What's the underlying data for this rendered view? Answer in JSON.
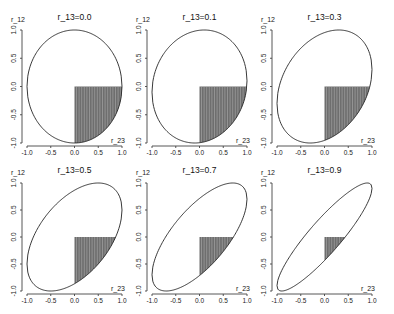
{
  "chart_data": {
    "type": "line",
    "layout": "2x3 small multiples",
    "xlabel": "r_23",
    "ylabel": "r_12",
    "xlim": [
      -1.0,
      1.0
    ],
    "ylim": [
      -1.0,
      1.0
    ],
    "xticks": [
      "-1.0",
      "-0.5",
      "0.0",
      "0.5",
      "1.0"
    ],
    "yticks": [
      "-1.0",
      "-0.5",
      "0.0",
      "0.5",
      "1.0"
    ],
    "grid": false,
    "shaded_region": {
      "r_23": [
        0.0,
        1.0
      ],
      "r_12": [
        -1.0,
        0.0
      ],
      "fill": "#6e6e6e",
      "pattern": "vertical-lines"
    },
    "panels": [
      {
        "title": "r_13=0.0",
        "r_13": 0.0
      },
      {
        "title": "r_13=0.1",
        "r_13": 0.1
      },
      {
        "title": "r_13=0.3",
        "r_13": 0.3
      },
      {
        "title": "r_13=0.5",
        "r_13": 0.5
      },
      {
        "title": "r_13=0.7",
        "r_13": 0.7
      },
      {
        "title": "r_13=0.9",
        "r_13": 0.9
      }
    ]
  }
}
